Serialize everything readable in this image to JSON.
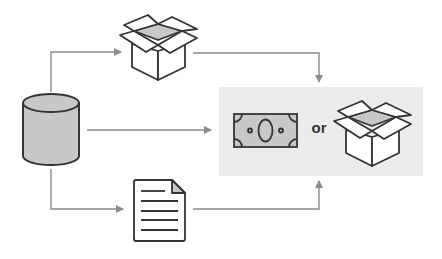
{
  "diagram": {
    "nodes": [
      {
        "id": "database",
        "shape": "cylinder-icon"
      },
      {
        "id": "box-top",
        "shape": "open-box-icon"
      },
      {
        "id": "document",
        "shape": "document-icon"
      },
      {
        "id": "output-panel",
        "contents": [
          "money-bill-icon",
          "open-box-icon"
        ]
      }
    ],
    "edges": [
      {
        "from": "database",
        "to": "box-top"
      },
      {
        "from": "database",
        "to": "output-panel"
      },
      {
        "from": "database",
        "to": "document"
      },
      {
        "from": "box-top",
        "to": "output-panel"
      },
      {
        "from": "document",
        "to": "output-panel"
      }
    ],
    "output_panel": {
      "separator_label": "or"
    },
    "colors": {
      "panel_bg": "#ececec",
      "arrow": "#8a8a8a",
      "stroke": "#333333",
      "fill_gray": "#c8c8c8"
    }
  }
}
